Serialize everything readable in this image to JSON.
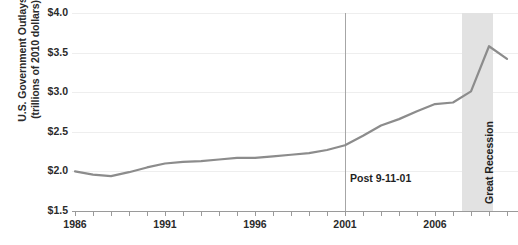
{
  "chart_data": {
    "type": "line",
    "title": "",
    "xlabel": "",
    "ylabel": "U.S. Government Outlays (trillions of 2010 dollars)",
    "ylabel_line1": "U.S. Government Outlays",
    "ylabel_line2": "(trillions of 2010 dollars)",
    "x": [
      1986,
      1987,
      1988,
      1989,
      1990,
      1991,
      1992,
      1993,
      1994,
      1995,
      1996,
      1997,
      1998,
      1999,
      2000,
      2001,
      2002,
      2003,
      2004,
      2005,
      2006,
      2007,
      2008,
      2009,
      2010
    ],
    "values": [
      2.0,
      1.96,
      1.94,
      1.99,
      2.05,
      2.1,
      2.12,
      2.13,
      2.15,
      2.17,
      2.17,
      2.19,
      2.21,
      2.23,
      2.27,
      2.33,
      2.45,
      2.58,
      2.66,
      2.76,
      2.85,
      2.87,
      3.01,
      3.58,
      3.42
    ],
    "xlim": [
      1986,
      2010
    ],
    "ylim": [
      1.5,
      4.0
    ],
    "ytick_values": [
      1.5,
      2.0,
      2.5,
      3.0,
      3.5,
      4.0
    ],
    "ytick_labels": [
      "$1.5",
      "$2.0",
      "$2.5",
      "$3.0",
      "$3.5",
      "$4.0"
    ],
    "xtick_values": [
      1986,
      1987,
      1988,
      1989,
      1990,
      1991,
      1992,
      1993,
      1994,
      1995,
      1996,
      1997,
      1998,
      1999,
      2000,
      2001,
      2002,
      2003,
      2004,
      2005,
      2006,
      2007,
      2008,
      2009,
      2010
    ],
    "xtick_labels_shown": [
      {
        "value": 1986,
        "label": "1986"
      },
      {
        "value": 1991,
        "label": "1991"
      },
      {
        "value": 1996,
        "label": "1996"
      },
      {
        "value": 2001,
        "label": "2001"
      },
      {
        "value": 2006,
        "label": "2006"
      }
    ],
    "grid": true,
    "legend": "none",
    "line_color": "#8c8c8c",
    "annotations": [
      {
        "name": "event-line",
        "label": "Post 9-11-01",
        "x": 2001,
        "type": "vline"
      },
      {
        "name": "recession-band",
        "label": "Great Recession",
        "x_start": 2007.5,
        "x_end": 2009.2,
        "type": "vspan",
        "color": "#e2e2e2"
      }
    ]
  },
  "annotations": {
    "event_label": "Post 9-11-01",
    "recession_label": "Great Recession"
  },
  "colors": {
    "line": "#8c8c8c",
    "band": "#e2e2e2",
    "axis": "#9a9a9a",
    "grid": "#eeeeee",
    "text": "#2b2b2b"
  }
}
